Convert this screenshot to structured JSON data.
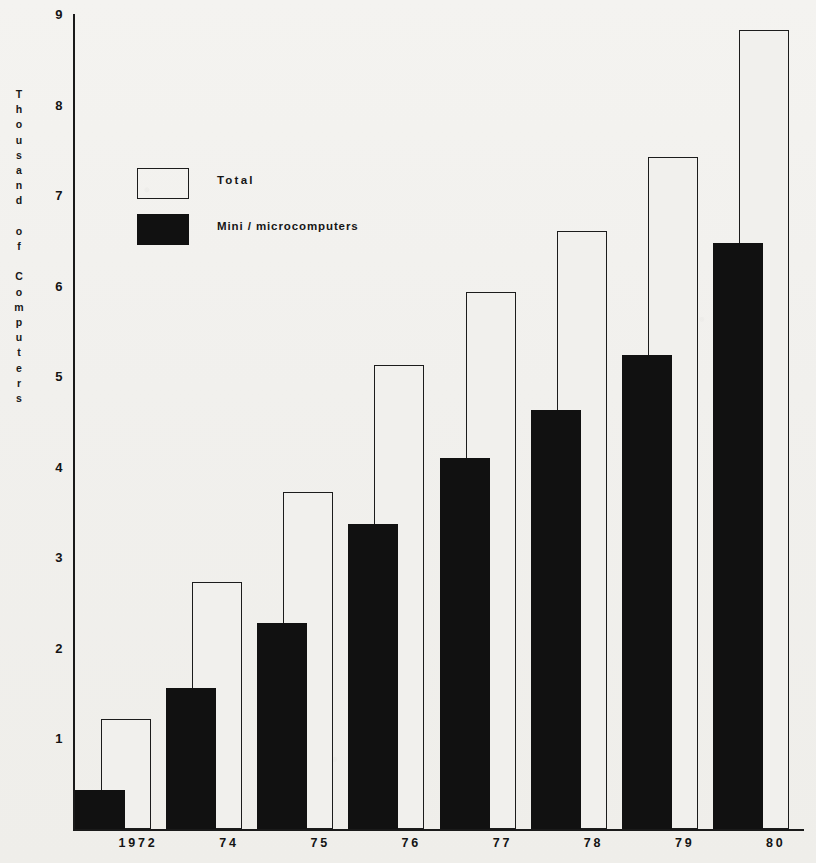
{
  "chart_data": {
    "type": "bar",
    "title": "",
    "subtitle": "",
    "xlabel": "",
    "ylabel": "Thousand of Computers",
    "categories": [
      "1972",
      "74",
      "75",
      "76",
      "77",
      "78",
      "79",
      "80"
    ],
    "series": [
      {
        "name": "Total",
        "style": "outline",
        "color": "#ffffff",
        "edge_color": "#1c1c1c",
        "values": [
          1.22,
          2.73,
          3.72,
          5.12,
          5.93,
          6.6,
          7.42,
          8.82
        ]
      },
      {
        "name": "Mini / microcomputers",
        "style": "filled",
        "color": "#111111",
        "edge_color": "#111111",
        "values": [
          0.43,
          1.56,
          2.27,
          3.37,
          4.1,
          4.63,
          5.24,
          6.47
        ]
      }
    ],
    "ylim": [
      0,
      9
    ],
    "y_ticks": [
      1,
      2,
      3,
      4,
      5,
      6,
      7,
      8,
      9
    ],
    "y_tick_labels": [
      "1",
      "2",
      "3",
      "4",
      "5",
      "6",
      "7",
      "8",
      "9"
    ],
    "grid": false,
    "legend_position": "upper left"
  },
  "legend": {
    "items": [
      {
        "label": "Total",
        "swatch": "outline-swatch"
      },
      {
        "label": "Mini / microcomputers",
        "swatch": "filled-swatch"
      }
    ]
  },
  "axes": {
    "y_title": "Thousand of Computers"
  }
}
